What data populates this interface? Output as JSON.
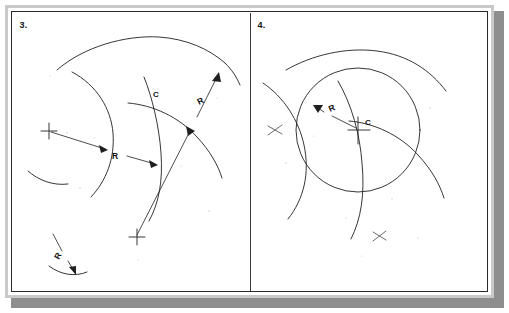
{
  "page": {
    "background_color": "#ffffff",
    "sheet_color": "#ffffff",
    "ink_color": "#1f1f1f",
    "frame_color": "#2a2a2a",
    "bevel_color": "#c9c9c9",
    "shadow_color": "#8e8e8e",
    "width": 509,
    "height": 313
  },
  "panels": [
    {
      "id": "panel-3",
      "number_label": "3.",
      "caption": "Arc tangent to two arcs — center located at intersection C of two construction arcs",
      "labels": [
        {
          "name": "radius-label-lower-left",
          "text": "R"
        },
        {
          "name": "radius-label-upper-right",
          "text": "R"
        },
        {
          "name": "radius-label-small-arc",
          "text": "R"
        },
        {
          "name": "center-label-c",
          "text": "C"
        }
      ],
      "center_marks": 3,
      "arcs": 6,
      "dimension_lines": 3
    },
    {
      "id": "panel-4",
      "number_label": "4.",
      "caption": "Required circle of radius R drawn from center C tangent to both given arcs",
      "labels": [
        {
          "name": "radius-label",
          "text": "R"
        },
        {
          "name": "center-label-c",
          "text": "C"
        }
      ],
      "center_marks": 2,
      "arcs": 4,
      "dimension_lines": 1
    }
  ],
  "glyphs": {
    "radius": "R",
    "center": "C",
    "cross_mark": "+"
  }
}
